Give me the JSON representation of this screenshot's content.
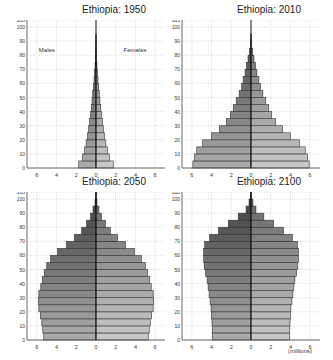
{
  "chart_data": [
    {
      "type": "bar",
      "subtype": "population-pyramid",
      "title": "Ethiopia: 1950",
      "xlabel": "",
      "ylabel": "",
      "xlim": [
        -7,
        7
      ],
      "ylim": [
        0,
        105
      ],
      "xticks": [
        -6,
        -4,
        -2,
        0,
        2,
        4,
        6
      ],
      "xtick_labels": [
        "6",
        "4",
        "2",
        "0",
        "2",
        "4",
        "6"
      ],
      "yticks": [
        0,
        10,
        20,
        30,
        40,
        50,
        60,
        70,
        80,
        90,
        100,
        105
      ],
      "grid": true,
      "annotations": [
        "Males",
        "Females"
      ],
      "age_groups": [
        "0-4",
        "5-9",
        "10-14",
        "15-19",
        "20-24",
        "25-29",
        "30-34",
        "35-39",
        "40-44",
        "45-49",
        "50-54",
        "55-59",
        "60-64",
        "65-69",
        "70-74",
        "75-79",
        "80-84",
        "85-89",
        "90-94",
        "95-99",
        "100+"
      ],
      "series": [
        {
          "name": "Males",
          "values": [
            1.75,
            1.35,
            1.15,
            1.0,
            0.85,
            0.75,
            0.65,
            0.55,
            0.48,
            0.4,
            0.33,
            0.27,
            0.2,
            0.15,
            0.1,
            0.07,
            0.04,
            0.02,
            0.01,
            0.0,
            0.0
          ]
        },
        {
          "name": "Females",
          "values": [
            1.75,
            1.35,
            1.15,
            1.0,
            0.85,
            0.75,
            0.65,
            0.55,
            0.48,
            0.4,
            0.33,
            0.27,
            0.2,
            0.15,
            0.1,
            0.07,
            0.04,
            0.02,
            0.01,
            0.0,
            0.0
          ]
        }
      ]
    },
    {
      "type": "bar",
      "subtype": "population-pyramid",
      "title": "Ethiopia: 2010",
      "xlim": [
        -7,
        7
      ],
      "ylim": [
        0,
        105
      ],
      "xticks": [
        -6,
        -4,
        -2,
        0,
        2,
        4,
        6
      ],
      "xtick_labels": [
        "6",
        "4",
        "2",
        "0",
        "2",
        "4",
        "6"
      ],
      "yticks": [
        0,
        10,
        20,
        30,
        40,
        50,
        60,
        70,
        80,
        90,
        100,
        105
      ],
      "grid": true,
      "age_groups": [
        "0-4",
        "5-9",
        "10-14",
        "15-19",
        "20-24",
        "25-29",
        "30-34",
        "35-39",
        "40-44",
        "45-49",
        "50-54",
        "55-59",
        "60-64",
        "65-69",
        "70-74",
        "75-79",
        "80-84",
        "85-89",
        "90-94",
        "95-99",
        "100+"
      ],
      "series": [
        {
          "name": "Males",
          "values": [
            5.9,
            5.75,
            5.5,
            4.9,
            4.0,
            3.2,
            2.5,
            2.1,
            1.8,
            1.5,
            1.2,
            0.95,
            0.8,
            0.6,
            0.45,
            0.3,
            0.15,
            0.05,
            0.02,
            0.0,
            0.0
          ]
        },
        {
          "name": "Females",
          "values": [
            5.9,
            5.75,
            5.5,
            4.9,
            4.0,
            3.2,
            2.5,
            2.1,
            1.8,
            1.5,
            1.2,
            0.95,
            0.8,
            0.6,
            0.45,
            0.3,
            0.15,
            0.05,
            0.02,
            0.0,
            0.0
          ]
        }
      ]
    },
    {
      "type": "bar",
      "subtype": "population-pyramid",
      "title": "Ethiopia: 2050",
      "xlim": [
        -7,
        7
      ],
      "ylim": [
        0,
        105
      ],
      "xticks": [
        -6,
        -4,
        -2,
        0,
        2,
        4,
        6
      ],
      "xtick_labels": [
        "6",
        "4",
        "2",
        "0",
        "2",
        "4",
        "6"
      ],
      "yticks": [
        0,
        10,
        20,
        30,
        40,
        50,
        60,
        70,
        80,
        90,
        100,
        105
      ],
      "grid": true,
      "age_groups": [
        "0-4",
        "5-9",
        "10-14",
        "15-19",
        "20-24",
        "25-29",
        "30-34",
        "35-39",
        "40-44",
        "45-49",
        "50-54",
        "55-59",
        "60-64",
        "65-69",
        "70-74",
        "75-79",
        "80-84",
        "85-89",
        "90-94",
        "95-99",
        "100+"
      ],
      "series": [
        {
          "name": "Males",
          "values": [
            5.3,
            5.4,
            5.5,
            5.65,
            5.8,
            5.85,
            5.8,
            5.6,
            5.45,
            5.25,
            5.0,
            4.6,
            3.9,
            3.0,
            2.2,
            1.45,
            0.95,
            0.55,
            0.3,
            0.1,
            0.03
          ]
        },
        {
          "name": "Females",
          "values": [
            5.3,
            5.4,
            5.5,
            5.65,
            5.8,
            5.85,
            5.8,
            5.6,
            5.45,
            5.25,
            5.0,
            4.6,
            3.9,
            3.0,
            2.2,
            1.45,
            0.95,
            0.55,
            0.3,
            0.1,
            0.03
          ]
        }
      ]
    },
    {
      "type": "bar",
      "subtype": "population-pyramid",
      "title": "Ethiopia: 2100",
      "xlim": [
        -7,
        7
      ],
      "ylim": [
        0,
        105
      ],
      "xticks": [
        -6,
        -4,
        -2,
        0,
        2,
        4,
        6
      ],
      "xtick_labels": [
        "6",
        "4",
        "2",
        "0",
        "2",
        "4",
        "6"
      ],
      "yticks": [
        0,
        10,
        20,
        30,
        40,
        50,
        60,
        70,
        80,
        90,
        100,
        105
      ],
      "grid": true,
      "unit_label": "(millions)",
      "age_groups": [
        "0-4",
        "5-9",
        "10-14",
        "15-19",
        "20-24",
        "25-29",
        "30-34",
        "35-39",
        "40-44",
        "45-49",
        "50-54",
        "55-59",
        "60-64",
        "65-69",
        "70-74",
        "75-79",
        "80-84",
        "85-89",
        "90-94",
        "95-99",
        "100+"
      ],
      "series": [
        {
          "name": "Males",
          "values": [
            3.9,
            3.9,
            3.95,
            4.0,
            4.05,
            4.15,
            4.25,
            4.35,
            4.45,
            4.6,
            4.75,
            4.8,
            4.8,
            4.7,
            4.2,
            3.3,
            2.3,
            1.3,
            0.5,
            0.2,
            0.05
          ]
        },
        {
          "name": "Females",
          "values": [
            3.9,
            3.9,
            3.95,
            4.0,
            4.05,
            4.15,
            4.25,
            4.35,
            4.45,
            4.6,
            4.75,
            4.8,
            4.8,
            4.7,
            4.2,
            3.3,
            2.3,
            1.3,
            0.5,
            0.2,
            0.05
          ]
        }
      ]
    }
  ],
  "labels": {
    "males": "Males",
    "females": "Females",
    "units": "(millions)"
  }
}
